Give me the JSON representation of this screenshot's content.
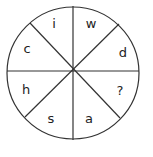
{
  "diagram": {
    "type": "letter-wheel-puzzle",
    "segments": [
      {
        "position": "top-left",
        "label": "i"
      },
      {
        "position": "top-right",
        "label": "w"
      },
      {
        "position": "right-upper",
        "label": "d"
      },
      {
        "position": "right-lower",
        "label": "?"
      },
      {
        "position": "bottom-right",
        "label": "a"
      },
      {
        "position": "bottom-left",
        "label": "s"
      },
      {
        "position": "left-lower",
        "label": "h"
      },
      {
        "position": "left-upper",
        "label": "c"
      }
    ],
    "colors": {
      "stroke": "#333333",
      "text": "#222222",
      "background": "#ffffff"
    }
  }
}
